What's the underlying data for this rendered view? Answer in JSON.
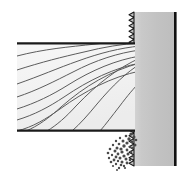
{
  "figure": {
    "width": 193,
    "height": 180,
    "background_color": "#ffffff"
  },
  "workpiece": {
    "name": "wood-block",
    "label": "Wood block",
    "x": 17,
    "y": 43,
    "width": 118,
    "height": 88,
    "fill_color": "#f4f4f4",
    "top_edge_color": "#1a1a1a",
    "bottom_edge_color": "#1a1a1a",
    "edge_thickness": 2.2,
    "grain": {
      "name": "wood-grain",
      "stroke_color": "#5a5a5a",
      "stroke_width": 1.0,
      "line_count": 9,
      "description": "wavy diagonal grain lines rising left to right"
    }
  },
  "blade": {
    "name": "saw-blade",
    "label": "Saw blade",
    "body_x": 134,
    "body_right": 176,
    "top_y": 12,
    "bottom_y": 166,
    "fill_color": "#c4c4c4",
    "gradient_light": "#d2d2d2",
    "gradient_dark": "#b8b8b8",
    "back_edge_color": "#111111",
    "back_edge_x": 174,
    "back_edge_width": 3,
    "teeth": {
      "name": "blade-teeth",
      "label": "Cutting teeth",
      "count": 28,
      "pitch": 5.5,
      "depth": 5.5,
      "stroke_color": "#1a1a1a",
      "stroke_width": 1.1,
      "side": "left"
    }
  },
  "debris": {
    "name": "sawdust",
    "label": "Sawdust",
    "fill_color": "#4a4a4a",
    "particle_count": 46,
    "region": {
      "x": 108,
      "y": 132,
      "width": 30,
      "height": 38
    },
    "particles": [
      [
        131,
        134,
        1.6
      ],
      [
        126,
        136,
        1.3
      ],
      [
        134,
        137,
        1.5
      ],
      [
        120,
        138,
        1.2
      ],
      [
        129,
        139,
        1.7
      ],
      [
        136,
        140,
        1.3
      ],
      [
        123,
        141,
        1.5
      ],
      [
        116,
        141,
        1.2
      ],
      [
        132,
        142,
        1.4
      ],
      [
        127,
        143,
        1.6
      ],
      [
        119,
        144,
        1.3
      ],
      [
        135,
        145,
        1.5
      ],
      [
        113,
        145,
        1.2
      ],
      [
        124,
        146,
        1.7
      ],
      [
        130,
        147,
        1.3
      ],
      [
        117,
        148,
        1.5
      ],
      [
        133,
        148,
        1.2
      ],
      [
        121,
        149,
        1.6
      ],
      [
        110,
        149,
        1.3
      ],
      [
        127,
        150,
        1.4
      ],
      [
        115,
        151,
        1.5
      ],
      [
        131,
        152,
        1.2
      ],
      [
        122,
        152,
        1.6
      ],
      [
        108,
        153,
        1.3
      ],
      [
        118,
        154,
        1.4
      ],
      [
        128,
        154,
        1.5
      ],
      [
        112,
        155,
        1.2
      ],
      [
        124,
        156,
        1.6
      ],
      [
        133,
        156,
        1.3
      ],
      [
        116,
        157,
        1.4
      ],
      [
        120,
        158,
        1.5
      ],
      [
        109,
        158,
        1.2
      ],
      [
        126,
        159,
        1.5
      ],
      [
        130,
        160,
        1.3
      ],
      [
        114,
        160,
        1.4
      ],
      [
        118,
        161,
        1.2
      ],
      [
        122,
        162,
        1.5
      ],
      [
        111,
        162,
        1.3
      ],
      [
        127,
        163,
        1.4
      ],
      [
        116,
        164,
        1.2
      ],
      [
        121,
        165,
        1.3
      ],
      [
        124,
        166,
        1.2
      ],
      [
        113,
        166,
        1.1
      ],
      [
        119,
        168,
        1.2
      ],
      [
        125,
        168,
        1.1
      ],
      [
        117,
        170,
        1.0
      ]
    ]
  }
}
